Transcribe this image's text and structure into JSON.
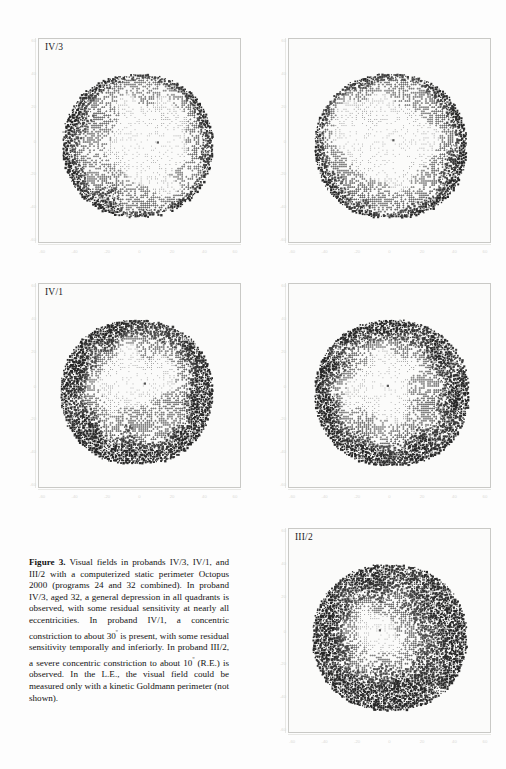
{
  "figure": {
    "label": "Figure 3.",
    "caption_text": " Visual fields in probands IV/3, IV/1, and III/2 with a computerized static perimeter Octopus 2000 (programs 24 and 32 combined). In proband IV/3, aged 32, a general depression in all quadrants is observed, with some residual sensitivity at nearly all eccentricities. In proband IV/1, a concentric constriction to about 30",
    "caption_text_2": " is present, with some residual sensitivity temporally and inferiorly. In proband III/2, a severe concentric constriction to about 10",
    "caption_text_3": " (R.E.) is observed. In the L.E., the visual field could be measured only with a kinetic Goldmann perimeter (not shown).",
    "degree_symbol": "º"
  },
  "panels": [
    {
      "id": "panel-iv3-right",
      "title": "IV/3",
      "eye": "right",
      "proband": "IV/3",
      "x_ticks": [
        "-60",
        "-40",
        "-20",
        "0",
        "20",
        "40",
        "60"
      ],
      "y_ticks": [
        "60",
        "40",
        "20",
        "0",
        "-20",
        "-40",
        "-60"
      ]
    },
    {
      "id": "panel-iv3-left",
      "title": "",
      "eye": "left",
      "proband": "IV/3",
      "x_ticks": [
        "-60",
        "-40",
        "-20",
        "0",
        "20",
        "40",
        "60"
      ],
      "y_ticks": [
        "60",
        "40",
        "20",
        "0",
        "-20",
        "-40",
        "-60"
      ]
    },
    {
      "id": "panel-iv1-right",
      "title": "IV/1",
      "eye": "right",
      "proband": "IV/1",
      "x_ticks": [
        "-60",
        "-40",
        "-20",
        "0",
        "20",
        "40",
        "60"
      ],
      "y_ticks": [
        "60",
        "40",
        "20",
        "0",
        "-20",
        "-40",
        "-60"
      ]
    },
    {
      "id": "panel-iv1-left",
      "title": "",
      "eye": "left",
      "proband": "IV/1",
      "x_ticks": [
        "-60",
        "-40",
        "-20",
        "0",
        "20",
        "40",
        "60"
      ],
      "y_ticks": [
        "60",
        "40",
        "20",
        "0",
        "-20",
        "-40",
        "-60"
      ]
    },
    {
      "id": "panel-iii2-right",
      "title": "III/2",
      "eye": "right",
      "proband": "III/2",
      "x_ticks": [
        "-60",
        "-40",
        "-20",
        "0",
        "20",
        "40",
        "60"
      ],
      "y_ticks": [
        "60",
        "40",
        "20",
        "0",
        "-20",
        "-40",
        "-60"
      ]
    }
  ],
  "chart_data": {
    "type": "heatmap",
    "title": "Visual fields in probands IV/3, IV/1, and III/2",
    "subtitle": "Computerized static perimeter Octopus 2000 (programs 24 and 32 combined)",
    "xlabel": "",
    "ylabel": "",
    "xlim": [
      -70,
      70
    ],
    "ylim": [
      -70,
      70
    ],
    "grid": false,
    "legend": "none",
    "encoding": "grey-scale stipple density: darker = greater sensitivity loss (depression); lighter = preserved sensitivity",
    "fields": [
      {
        "name": "IV/3 right eye",
        "radius_deg": 60,
        "description": "General depression in all quadrants with residual sensitivity at nearly all eccentricities",
        "light_center_offset": [
          8,
          2
        ],
        "light_center_radius_deg": 20,
        "dark_rim_thickness_deg": 12
      },
      {
        "name": "IV/3 left eye",
        "radius_deg": 60,
        "description": "General depression in all quadrants with residual sensitivity at nearly all eccentricities",
        "light_center_offset": [
          -6,
          4
        ],
        "light_center_radius_deg": 22,
        "dark_rim_thickness_deg": 12
      },
      {
        "name": "IV/1 right eye",
        "radius_deg": 60,
        "description": "Concentric constriction to about 30 degrees; residual sensitivity temporally and inferiorly",
        "light_center_offset": [
          2,
          6
        ],
        "light_center_radius_deg": 11,
        "dark_rim_thickness_deg": 26
      },
      {
        "name": "IV/1 left eye",
        "radius_deg": 60,
        "description": "Concentric constriction to about 30 degrees; residual sensitivity temporally and inferiorly",
        "light_center_offset": [
          -7,
          5
        ],
        "light_center_radius_deg": 11,
        "dark_rim_thickness_deg": 26
      },
      {
        "name": "III/2 right eye",
        "radius_deg": 60,
        "description": "Severe concentric constriction to about 10 degrees (R.E.)",
        "light_center_offset": [
          -10,
          5
        ],
        "light_center_radius_deg": 7,
        "dark_rim_thickness_deg": 44
      }
    ]
  },
  "colors": {
    "page_background": "#fdfdfd",
    "panel_background": "#fbfbfa",
    "panel_border": "#c9c9c6",
    "text": "#121212",
    "stipple_dark": "#4a4a4a",
    "tick_label": "#dadad6"
  }
}
